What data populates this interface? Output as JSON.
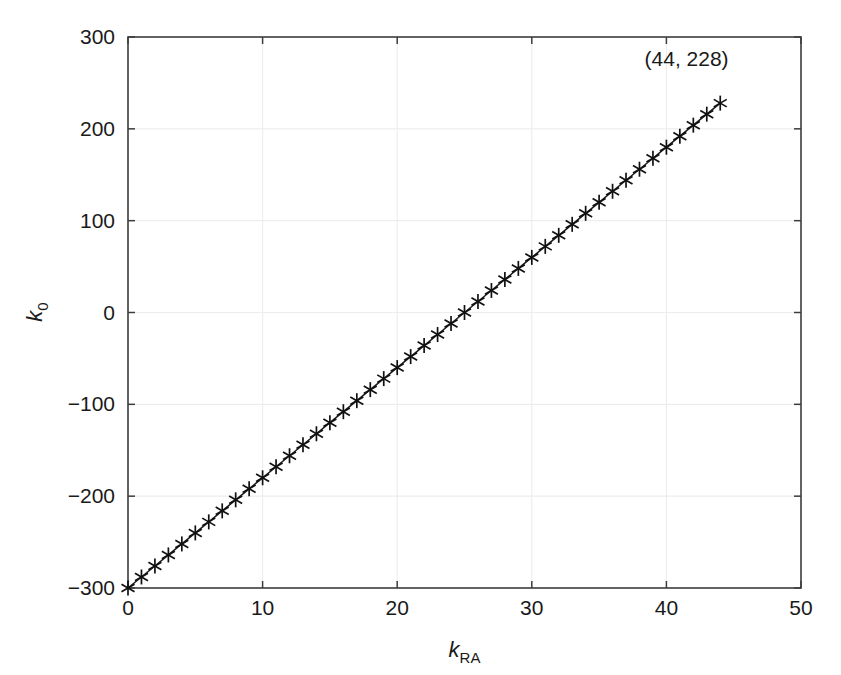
{
  "figure": {
    "width": 841,
    "height": 675,
    "background": "#ffffff"
  },
  "chart_data": {
    "type": "line",
    "title": "",
    "subtitle": "",
    "xlabel": "k_RA",
    "xlabel_base": "k",
    "xlabel_sub": "RA",
    "ylabel": "k_0",
    "ylabel_base": "k",
    "ylabel_sub": "0",
    "xlim": [
      0,
      50
    ],
    "ylim": [
      -300,
      300
    ],
    "xticks": [
      0,
      10,
      20,
      30,
      40,
      50
    ],
    "xticklabels": [
      "0",
      "10",
      "20",
      "30",
      "40",
      "50"
    ],
    "yticks": [
      -300,
      -200,
      -100,
      0,
      100,
      200,
      300
    ],
    "yticklabels": [
      "-300",
      "-200",
      "-100",
      "0",
      "100",
      "200",
      "300"
    ],
    "grid": true,
    "grid_color": "#ededf0",
    "legend": null,
    "marker": "asterisk",
    "marker_color": "#111111",
    "line_color": "#1a1a1a",
    "relation": "k_0 = 12 * k_RA - 300",
    "slope": 12,
    "intercept": -300,
    "series": [
      {
        "name": "k0 vs kRA",
        "x": [
          0,
          1,
          2,
          3,
          4,
          5,
          6,
          7,
          8,
          9,
          10,
          11,
          12,
          13,
          14,
          15,
          16,
          17,
          18,
          19,
          20,
          21,
          22,
          23,
          24,
          25,
          26,
          27,
          28,
          29,
          30,
          31,
          32,
          33,
          34,
          35,
          36,
          37,
          38,
          39,
          40,
          41,
          42,
          43,
          44
        ],
        "values": [
          -300,
          -288,
          -276,
          -264,
          -252,
          -240,
          -228,
          -216,
          -204,
          -192,
          -180,
          -168,
          -156,
          -144,
          -132,
          -120,
          -108,
          -96,
          -84,
          -72,
          -60,
          -48,
          -36,
          -24,
          -12,
          0,
          12,
          24,
          36,
          48,
          60,
          72,
          84,
          96,
          108,
          120,
          132,
          144,
          156,
          168,
          180,
          192,
          204,
          216,
          228
        ]
      }
    ],
    "annotations": [
      {
        "text": "(44, 228)",
        "point_x": 44,
        "point_y": 228,
        "label_x": 41.5,
        "label_y": 268
      }
    ]
  }
}
